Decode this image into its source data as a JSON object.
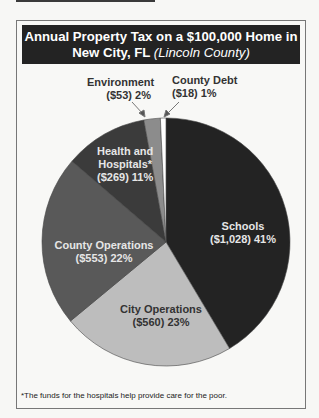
{
  "header": {
    "title_main": "Annual Property Tax on a $100,000 Home in New City, FL",
    "title_line1": "Annual Property Tax on a $100,000 Home in",
    "title_line2": "New City, FL",
    "title_sub": "(Lincoln County)"
  },
  "labels": {
    "schools": {
      "name": "Schools",
      "detail": "($1,028) 41%"
    },
    "city_ops": {
      "name": "City Operations",
      "detail": "($560) 23%"
    },
    "county_ops": {
      "name": "County Operations",
      "detail": "($553) 22%"
    },
    "health": {
      "name_1": "Health and",
      "name_2": "Hospitals*",
      "detail": "($269) 11%"
    },
    "environment": {
      "name": "Environment",
      "detail": "($53) 2%"
    },
    "county_debt": {
      "name": "County Debt",
      "detail": "($18) 1%"
    }
  },
  "footnote": "*The funds for the hospitals help provide care for the poor.",
  "colors": {
    "schools": "#232323",
    "city_ops": "#bdbdbd",
    "county_ops": "#595959",
    "health": "#3b3b3b",
    "environment": "#8c8c8c",
    "county_debt": "#ffffff"
  },
  "chart_data": {
    "type": "pie",
    "title": "Annual Property Tax on a $100,000 Home in New City, FL (Lincoln County)",
    "categories": [
      "Schools",
      "City Operations",
      "County Operations",
      "Health and Hospitals*",
      "Environment",
      "County Debt"
    ],
    "values": [
      1028,
      560,
      553,
      269,
      53,
      18
    ],
    "percentages": [
      41,
      23,
      22,
      11,
      2,
      1
    ],
    "units": "USD",
    "start_angle": "12 o'clock, clockwise",
    "annotations": [
      "*The funds for the hospitals help provide care for the poor."
    ],
    "legend": "none (labels inside/near slices)"
  }
}
